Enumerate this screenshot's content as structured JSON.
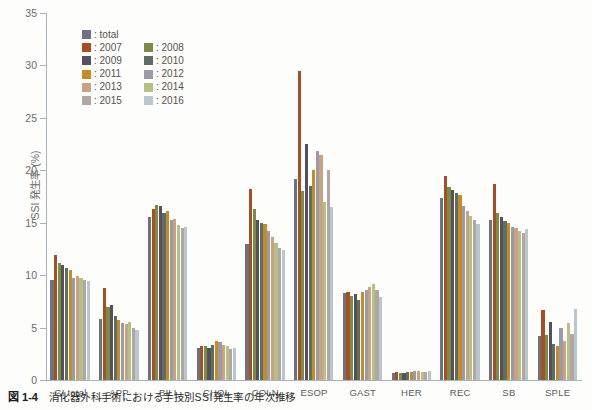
{
  "caption": {
    "number": "図 1-4",
    "text": "消化器外科手術における手技別SSI発生率の年次推移"
  },
  "legend": {
    "entries": [
      {
        "label": ": total",
        "series": "total",
        "color": "#6e7180"
      },
      {
        "label": ": 2007",
        "series": "2007",
        "color": "#a84e23"
      },
      {
        "label": ": 2008",
        "series": "2008",
        "color": "#7d8c42"
      },
      {
        "label": ": 2009",
        "series": "2009",
        "color": "#55505f"
      },
      {
        "label": ": 2010",
        "series": "2010",
        "color": "#5f6e65"
      },
      {
        "label": ": 2011",
        "series": "2011",
        "color": "#c58b24"
      },
      {
        "label": ": 2012",
        "series": "2012",
        "color": "#9c9aa6"
      },
      {
        "label": ": 2013",
        "series": "2013",
        "color": "#c8a285"
      },
      {
        "label": ": 2014",
        "series": "2014",
        "color": "#b6c080"
      },
      {
        "label": ": 2015",
        "series": "2015",
        "color": "#b0a6a4"
      },
      {
        "label": ": 2016",
        "series": "2016",
        "color": "#b9c6cb"
      }
    ]
  },
  "chart_data": {
    "type": "bar",
    "title": "",
    "xlabel": "",
    "ylabel": "SSI 発生率 (%)",
    "ylim": [
      0,
      35
    ],
    "yticks": [
      0,
      5,
      10,
      15,
      20,
      25,
      30,
      35
    ],
    "grid": false,
    "legend_position": "top-left",
    "categories": [
      "GI total",
      "APP",
      "BILI",
      "CHOL",
      "COLN",
      "ESOP",
      "GAST",
      "HER",
      "REC",
      "SB",
      "SPLE"
    ],
    "series": [
      {
        "name": "total",
        "color": "#6e7180",
        "values": [
          9.5,
          5.8,
          15.5,
          3.1,
          13.0,
          19.2,
          8.3,
          0.7,
          17.4,
          15.3,
          4.2
        ]
      },
      {
        "name": "2007",
        "color": "#a84e23",
        "values": [
          11.9,
          8.8,
          16.3,
          3.2,
          18.2,
          29.5,
          8.4,
          0.8,
          19.5,
          18.7,
          6.7
        ]
      },
      {
        "name": "2008",
        "color": "#7d8c42",
        "values": [
          11.2,
          7.0,
          16.7,
          3.2,
          16.3,
          18.0,
          8.0,
          0.7,
          18.4,
          15.9,
          4.3
        ]
      },
      {
        "name": "2009",
        "color": "#55505f",
        "values": [
          11.0,
          7.2,
          16.6,
          3.1,
          15.3,
          22.5,
          8.2,
          0.7,
          18.1,
          15.5,
          5.5
        ]
      },
      {
        "name": "2010",
        "color": "#5f6e65",
        "values": [
          10.7,
          6.1,
          15.9,
          3.3,
          15.0,
          18.5,
          7.6,
          0.8,
          17.8,
          15.2,
          3.4
        ]
      },
      {
        "name": "2011",
        "color": "#c58b24",
        "values": [
          10.5,
          5.7,
          16.1,
          3.7,
          14.9,
          20.0,
          8.4,
          0.8,
          17.6,
          15.0,
          3.2
        ]
      },
      {
        "name": "2012",
        "color": "#9c9aa6",
        "values": [
          9.7,
          5.4,
          15.3,
          3.6,
          14.2,
          21.8,
          8.6,
          0.9,
          16.6,
          14.6,
          5.0
        ]
      },
      {
        "name": "2013",
        "color": "#c8a285",
        "values": [
          9.9,
          5.3,
          15.4,
          3.3,
          13.6,
          21.5,
          8.9,
          0.9,
          16.1,
          14.5,
          3.7
        ]
      },
      {
        "name": "2014",
        "color": "#b6c080",
        "values": [
          9.7,
          5.5,
          14.8,
          3.2,
          13.1,
          17.0,
          9.2,
          0.8,
          15.6,
          14.2,
          5.4
        ]
      },
      {
        "name": "2015",
        "color": "#b0a6a4",
        "values": [
          9.5,
          5.0,
          14.5,
          3.0,
          12.6,
          20.0,
          8.6,
          0.8,
          15.3,
          14.0,
          4.4
        ]
      },
      {
        "name": "2016",
        "color": "#b9c6cb",
        "values": [
          9.4,
          4.8,
          14.6,
          3.1,
          12.4,
          16.5,
          7.9,
          0.9,
          14.9,
          14.4,
          6.8
        ]
      }
    ]
  }
}
